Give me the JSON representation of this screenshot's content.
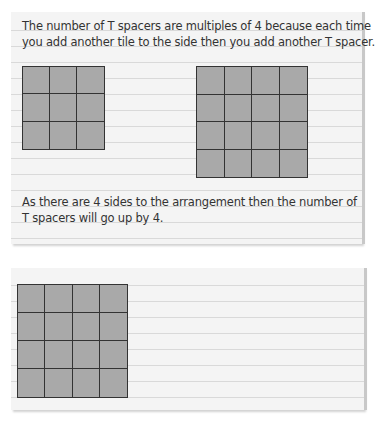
{
  "note1": {
    "line1": "The number of T spacers are multiples of 4 because each time",
    "line2": "you add another tile to the side then you add another T spacer.",
    "line3": "As there are 4 sides to the arrangement then the number of",
    "line4": "T spacers will go up by 4."
  },
  "figures": {
    "grid_a": {
      "rows": 3,
      "cols": 3,
      "spacer_type": "T"
    },
    "grid_b": {
      "rows": 4,
      "cols": 4,
      "spacer_type": "T"
    },
    "grid_c": {
      "rows": 4,
      "cols": 4,
      "spacer_type": "cross"
    }
  },
  "colors": {
    "tile": "#a9a9a9",
    "paper": "#f4f4f4",
    "rule": "#d9d9d9",
    "ink": "#333333"
  }
}
